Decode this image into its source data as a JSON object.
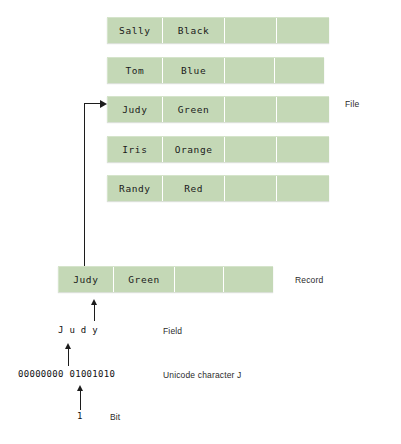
{
  "diagram": {
    "accent_color": "#c4d8b6",
    "line_color": "#1c1c1c",
    "file": {
      "label": "File",
      "rows": [
        {
          "first": "Sally",
          "last": "Black",
          "c3": "",
          "c4": ""
        },
        {
          "first": "Tom",
          "last": "Blue",
          "c3": "",
          "c4": ""
        },
        {
          "first": "Judy",
          "last": "Green",
          "c3": "",
          "c4": ""
        },
        {
          "first": "Iris",
          "last": "Orange",
          "c3": "",
          "c4": ""
        },
        {
          "first": "Randy",
          "last": "Red",
          "c3": "",
          "c4": ""
        }
      ]
    },
    "record": {
      "label": "Record",
      "cells": {
        "first": "Judy",
        "last": "Green",
        "c3": "",
        "c4": ""
      }
    },
    "field": {
      "label": "Field",
      "text": "J u d y"
    },
    "character": {
      "label": "Unicode character J",
      "text": "00000000 01001010"
    },
    "bit": {
      "label": "Bit",
      "text": "1"
    },
    "corner": {
      "mark": ""
    }
  }
}
